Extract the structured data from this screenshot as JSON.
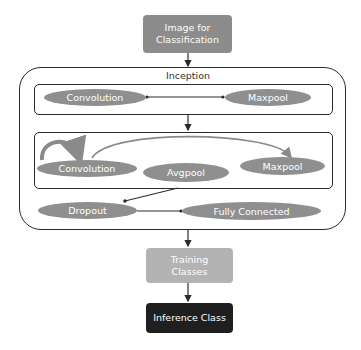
{
  "diagram": {
    "input_box": {
      "line1": "Image for",
      "line2": "Classification",
      "color": "#8c8c8c"
    },
    "inception": {
      "title": "Inception",
      "block1": {
        "nodes": [
          {
            "label": "Convolution"
          },
          {
            "label": "Maxpool"
          }
        ]
      },
      "block2": {
        "nodes": [
          {
            "label": "Convolution"
          },
          {
            "label": "Avgpool"
          },
          {
            "label": "Maxpool"
          }
        ]
      },
      "tail": {
        "nodes": [
          {
            "label": "Dropout"
          },
          {
            "label": "Fully Connected"
          }
        ]
      }
    },
    "training_box": {
      "line1": "Training",
      "line2": "Classes",
      "color": "#b3b3b3"
    },
    "inference_box": {
      "label": "Inference Class",
      "color": "#1f1f1f"
    },
    "ellipse_color": "#8f8f8f",
    "line_color": "#2a2a2a"
  }
}
